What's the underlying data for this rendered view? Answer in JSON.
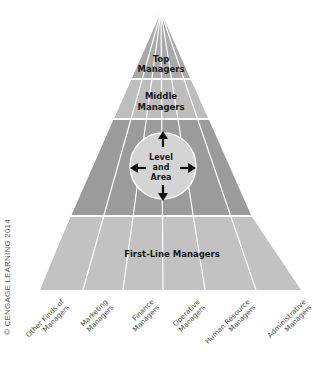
{
  "diagram": {
    "levels": [
      {
        "label_line1": "Top",
        "label_line2": "Managers"
      },
      {
        "label_line1": "Middle",
        "label_line2": "Managers"
      },
      {
        "label_line1": "",
        "label_line2": ""
      },
      {
        "label_line1": "First-Line Managers",
        "label_line2": ""
      }
    ],
    "center_circle": {
      "line1": "Level",
      "line2": "and",
      "line3": "Area"
    },
    "areas": [
      {
        "line1": "Other Kinds of",
        "line2": "Managers"
      },
      {
        "line1": "Marketing",
        "line2": "Managers"
      },
      {
        "line1": "Finance",
        "line2": "Managers"
      },
      {
        "line1": "Operative",
        "line2": "Managers"
      },
      {
        "line1": "Human Resource",
        "line2": "Managers"
      },
      {
        "line1": "Administrative",
        "line2": "Managers"
      }
    ],
    "colors": {
      "top_band": "#a9a9a9",
      "middle_band": "#bdbdbd",
      "third_band": "#9b9b9b",
      "first_line_band": "#c2c2c2",
      "circle": "#d4d4d4",
      "lines": "#ffffff",
      "text": "#1a1a1a"
    }
  },
  "copyright": "© CENGAGE LEARNING 2014"
}
